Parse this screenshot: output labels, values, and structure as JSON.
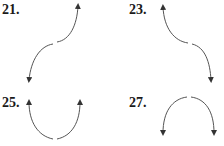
{
  "problems": [
    {
      "number": "21.",
      "shape": "rising S-curve: falls to the left, rises to the right"
    },
    {
      "number": "23.",
      "shape": "falling S-curve: rises to the left, falls to the right"
    },
    {
      "number": "25.",
      "shape": "U-shape: rises on both ends"
    },
    {
      "number": "27.",
      "shape": "inverted U: falls on both ends"
    }
  ],
  "colors": {
    "stroke": "#555555",
    "label": "#1a1a1a"
  }
}
